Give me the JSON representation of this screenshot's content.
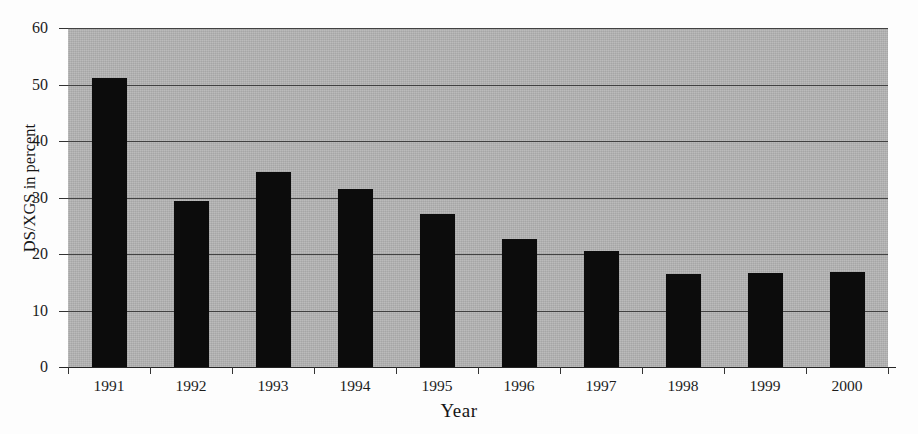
{
  "chart_data": {
    "type": "bar",
    "title": "",
    "xlabel": "Year",
    "ylabel": "DS/XGS in percent",
    "categories": [
      "1991",
      "1992",
      "1993",
      "1994",
      "1995",
      "1996",
      "1997",
      "1998",
      "1999",
      "2000"
    ],
    "values": [
      51.2,
      29.4,
      34.5,
      31.5,
      27.1,
      22.7,
      20.5,
      16.5,
      16.7,
      16.8
    ],
    "ylim": [
      0,
      60
    ],
    "yticks": [
      0,
      10,
      20,
      30,
      40,
      50,
      60
    ],
    "ytick_labels": [
      "0",
      "10",
      "20",
      "30",
      "40",
      "50",
      "60"
    ],
    "grid": true,
    "legend": "none",
    "bar_color": "#0c0c0c",
    "plot_background_color": "#b4b4b4",
    "page_background_color": "#ffffff"
  }
}
